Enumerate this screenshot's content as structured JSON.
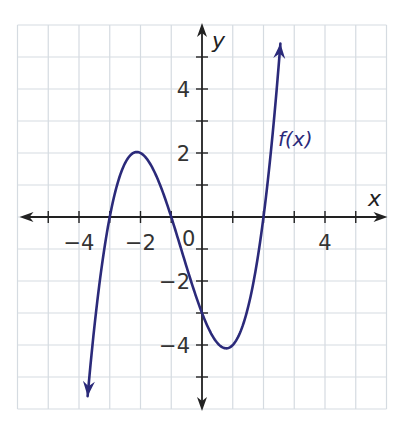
{
  "chart_data": {
    "type": "line",
    "title": "",
    "xlabel": "x",
    "ylabel": "y",
    "xlim": [
      -6,
      6
    ],
    "ylim": [
      -6,
      6
    ],
    "grid": true,
    "grid_step": 1,
    "x_tick_labels": [
      {
        "value": -4,
        "label": "−4"
      },
      {
        "value": -2,
        "label": "−2"
      },
      {
        "value": 4,
        "label": "4"
      }
    ],
    "y_tick_labels": [
      {
        "value": 4,
        "label": "4"
      },
      {
        "value": 2,
        "label": "2"
      },
      {
        "value": -2,
        "label": "−2"
      },
      {
        "value": -4,
        "label": "−4"
      }
    ],
    "origin_label": "0",
    "series": [
      {
        "name": "f(x)",
        "label": "f(x)",
        "color": "#2b2a7a",
        "description": "cubic with arrows at both ends",
        "x_intercepts": [
          -3,
          -1,
          2
        ],
        "y_intercept": -3,
        "local_max": [
          -2.1,
          2.0
        ],
        "local_min": [
          0.8,
          -4.1
        ],
        "x": [
          -3.72,
          -3.5,
          -3.25,
          -3.0,
          -2.75,
          -2.5,
          -2.25,
          -2.0,
          -1.75,
          -1.5,
          -1.25,
          -1.0,
          -0.75,
          -0.5,
          -0.25,
          0.0,
          0.25,
          0.5,
          0.75,
          1.0,
          1.25,
          1.5,
          1.75,
          2.0,
          2.25,
          2.5,
          2.55
        ],
        "y": [
          -6.0,
          -4.12,
          -1.88,
          0.0,
          1.47,
          2.0,
          2.03,
          2.0,
          1.55,
          1.31,
          0.83,
          0.0,
          -0.72,
          -1.56,
          -2.33,
          -3.0,
          -3.52,
          -3.94,
          -4.13,
          -4.0,
          -3.68,
          -2.81,
          -1.55,
          0.0,
          1.87,
          4.06,
          6.0
        ]
      }
    ],
    "annotations": [
      {
        "text": "f(x)",
        "x": 1.5,
        "y": 2.45
      }
    ]
  },
  "axes": {
    "x_label": "x",
    "y_label": "y",
    "origin": "0"
  },
  "curve": {
    "label": "f(x)",
    "color": "#2b2a7a"
  },
  "colors": {
    "grid": "#d5dbe1",
    "axis": "#222222",
    "curve": "#2b2a7a"
  }
}
